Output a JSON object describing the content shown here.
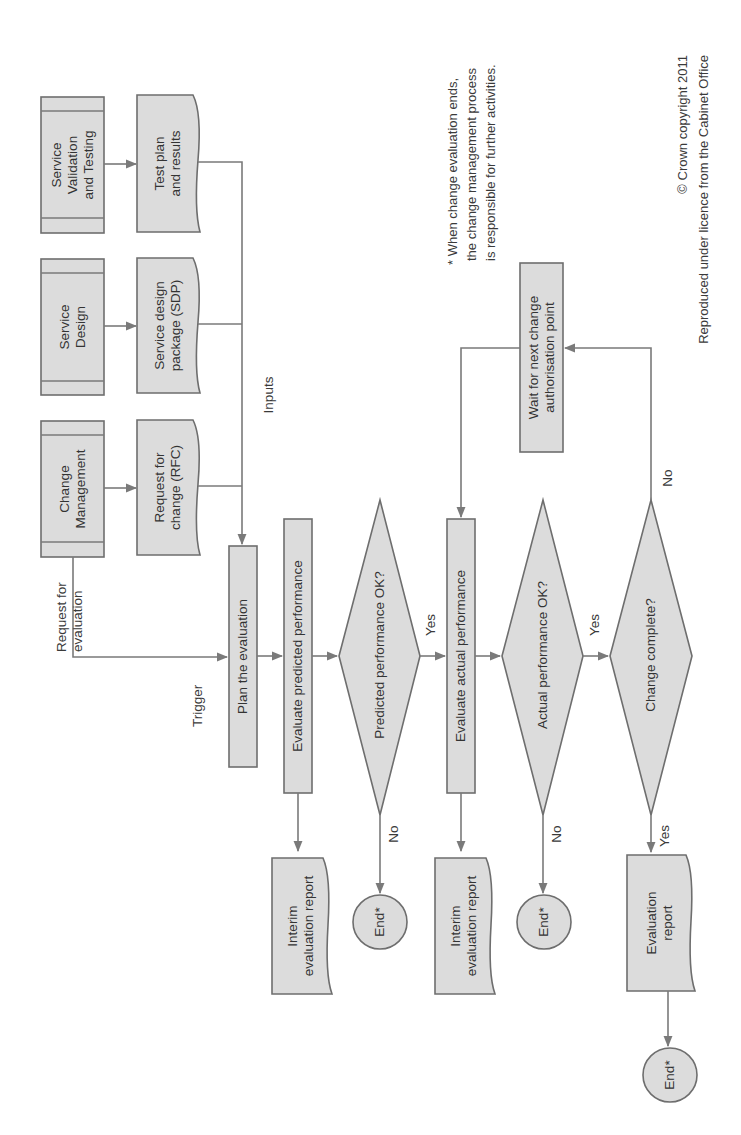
{
  "diagram": {
    "orientation": "rotated-90-ccw",
    "colors": {
      "fill": "#dcdcdc",
      "stroke": "#6e6e6e",
      "connector": "#7a7a7a",
      "text": "#333333"
    },
    "sources": [
      {
        "id": "svt",
        "line1": "Service",
        "line2": "Validation",
        "line3": "and Testing"
      },
      {
        "id": "sd",
        "line1": "Service",
        "line2": "Design"
      },
      {
        "id": "cm",
        "line1": "Change",
        "line2": "Management"
      }
    ],
    "inputs": [
      {
        "id": "tp",
        "line1": "Test plan",
        "line2": "and results"
      },
      {
        "id": "sdp",
        "line1": "Service design",
        "line2": "package (SDP)"
      },
      {
        "id": "rfc",
        "line1": "Request for",
        "line2": "change (RFC)"
      }
    ],
    "labels": {
      "inputs": "Inputs",
      "request_line1": "Request for",
      "request_line2": "evaluation",
      "trigger": "Trigger"
    },
    "processes": {
      "plan": "Plan the evaluation",
      "eval_predicted": "Evaluate predicted performance",
      "eval_actual": "Evaluate actual performance",
      "wait_line1": "Wait for next change",
      "wait_line2": "authorisation point"
    },
    "decisions": {
      "predicted_ok": "Predicted performance OK?",
      "actual_ok": "Actual performance OK?",
      "change_complete": "Change complete?"
    },
    "edge_labels": {
      "yes": "Yes",
      "no": "No"
    },
    "outputs": {
      "interim_line1": "Interim",
      "interim_line2": "evaluation report",
      "final_line1": "Evaluation",
      "final_line2": "report",
      "end": "End*"
    },
    "footnote": {
      "line1": "* When change evaluation ends,",
      "line2": "the change management process",
      "line3": "is responsible for further activities."
    },
    "copyright": {
      "line1": "© Crown copyright 2011",
      "line2": "Reproduced under licence from the Cabinet Office"
    }
  }
}
